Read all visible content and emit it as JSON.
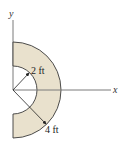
{
  "figure": {
    "type": "half-annulus area diagram",
    "axes": {
      "x_label": "x",
      "y_label": "y"
    },
    "dimensions": {
      "inner_radius_label": "2 ft",
      "outer_radius_label": "4 ft"
    },
    "colors": {
      "fill": "#e9e1cd",
      "stroke": "#3a3a3a",
      "axis": "#7a7a7a"
    }
  }
}
